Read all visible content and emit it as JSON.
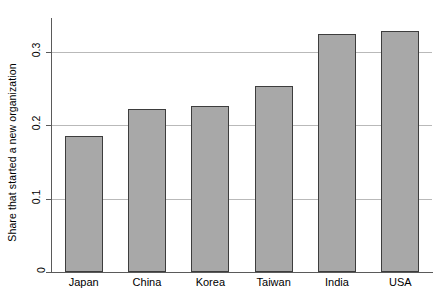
{
  "chart_data": {
    "type": "bar",
    "title": "",
    "subtitle": "",
    "xlabel": "",
    "ylabel": "Share that started a new organization",
    "categories": [
      "Japan",
      "China",
      "Korea",
      "Taiwan",
      "India",
      "USA"
    ],
    "values": [
      0.185,
      0.222,
      0.226,
      0.254,
      0.324,
      0.328
    ],
    "series": [
      {
        "name": "Share that started a new organization",
        "values": [
          0.185,
          0.222,
          0.226,
          0.254,
          0.324,
          0.328
        ]
      }
    ],
    "ylim": [
      0,
      0.345
    ],
    "xlim": [
      0,
      6
    ],
    "yticks": [
      0,
      0.1,
      0.2,
      0.3
    ],
    "ytick_labels": [
      "0",
      "0.1",
      "0.2",
      "0.3"
    ],
    "grid": "horizontal",
    "legend": "none",
    "bar_fill_color": "#a8a8a8",
    "bar_border_color": "#3d3d3d",
    "gridline_color": "#b9b9b9",
    "axis_color": "#5a5a5a",
    "background_color": "#ffffff"
  }
}
